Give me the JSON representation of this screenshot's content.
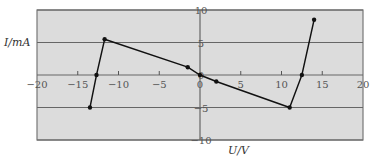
{
  "chart_data": {
    "type": "line",
    "title": "",
    "xlabel": "U/V",
    "ylabel": "I/mA",
    "xlim": [
      -20,
      20
    ],
    "ylim": [
      -10,
      10
    ],
    "x_ticks": [
      -20,
      -15,
      -10,
      -5,
      0,
      5,
      10,
      15,
      20
    ],
    "y_ticks": [
      -10,
      -5,
      0,
      5,
      10
    ],
    "grid": {
      "horizontal": true,
      "vertical": false
    },
    "legend": null,
    "series": [
      {
        "name": "I-U curve",
        "points": [
          {
            "x": -13.5,
            "y": -5
          },
          {
            "x": -12.7,
            "y": 0
          },
          {
            "x": -11.7,
            "y": 5.5
          },
          {
            "x": -1.5,
            "y": 1.2
          },
          {
            "x": 0,
            "y": 0
          },
          {
            "x": 2,
            "y": -1
          },
          {
            "x": 11,
            "y": -5
          },
          {
            "x": 12.5,
            "y": 0
          },
          {
            "x": 14,
            "y": 8.5
          }
        ]
      }
    ],
    "colors": {
      "plot_background": "#dcdcdc",
      "gridline": "#666666",
      "frame": "#777777",
      "line": "#111111"
    }
  }
}
